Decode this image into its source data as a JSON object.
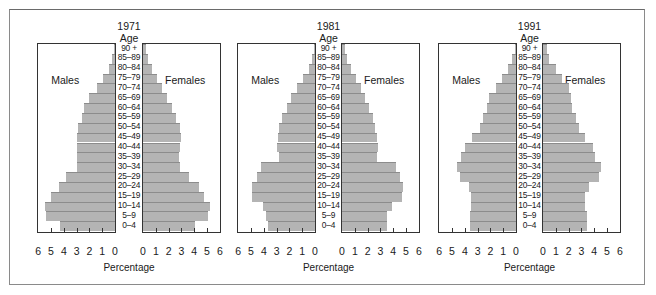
{
  "chart_data": [
    {
      "type": "bar",
      "subtype": "population-pyramid",
      "title": "1971",
      "ylabel": "Age",
      "xlabel": "Percentage",
      "left_label": "Males",
      "right_label": "Females",
      "xlim": [
        0,
        6
      ],
      "x_ticks": [
        6,
        5,
        4,
        3,
        2,
        1,
        0,
        0,
        1,
        2,
        3,
        4,
        5,
        6
      ],
      "categories": [
        "90 +",
        "85–89",
        "80–84",
        "75–79",
        "70–74",
        "65–69",
        "60–64",
        "55–59",
        "50–54",
        "45–49",
        "40–44",
        "35–39",
        "30–34",
        "25–29",
        "20–24",
        "15–19",
        "10–14",
        "5–9",
        "0–4"
      ],
      "series": [
        {
          "name": "Males",
          "values": [
            0.1,
            0.2,
            0.5,
            0.9,
            1.4,
            2.0,
            2.4,
            2.6,
            2.9,
            3.0,
            3.0,
            3.0,
            3.0,
            3.8,
            4.4,
            5.0,
            5.5,
            5.4,
            4.3
          ]
        },
        {
          "name": "Females",
          "values": [
            0.2,
            0.4,
            0.7,
            1.1,
            1.5,
            1.9,
            2.3,
            2.6,
            2.9,
            3.0,
            2.9,
            2.8,
            2.9,
            3.6,
            4.4,
            4.8,
            5.2,
            5.1,
            4.1
          ]
        }
      ]
    },
    {
      "type": "bar",
      "subtype": "population-pyramid",
      "title": "1981",
      "ylabel": "Age",
      "xlabel": "Percentage",
      "left_label": "Males",
      "right_label": "Females",
      "xlim": [
        0,
        6
      ],
      "x_ticks": [
        6,
        5,
        4,
        3,
        2,
        1,
        0,
        0,
        1,
        2,
        3,
        4,
        5,
        6
      ],
      "categories": [
        "90 +",
        "85–89",
        "80–84",
        "75–79",
        "70–74",
        "65–69",
        "60–64",
        "55–59",
        "50–54",
        "45–49",
        "40–44",
        "35–39",
        "30–34",
        "25–29",
        "20–24",
        "15–19",
        "10–14",
        "5–9",
        "0–4"
      ],
      "series": [
        {
          "name": "Males",
          "values": [
            0.1,
            0.2,
            0.5,
            0.9,
            1.4,
            1.9,
            2.2,
            2.6,
            2.8,
            2.9,
            3.0,
            2.8,
            4.2,
            4.5,
            4.9,
            4.9,
            4.1,
            3.8,
            3.7
          ]
        },
        {
          "name": "Females",
          "values": [
            0.2,
            0.4,
            0.7,
            1.1,
            1.5,
            1.8,
            2.1,
            2.4,
            2.6,
            2.7,
            2.8,
            2.7,
            4.2,
            4.5,
            4.8,
            4.7,
            3.9,
            3.5,
            3.5
          ]
        }
      ]
    },
    {
      "type": "bar",
      "subtype": "population-pyramid",
      "title": "1991",
      "ylabel": "Age",
      "xlabel": "Percentage",
      "left_label": "Males",
      "right_label": "Females",
      "xlim": [
        0,
        6
      ],
      "x_ticks": [
        6,
        5,
        4,
        3,
        2,
        1,
        0,
        0,
        1,
        2,
        3,
        4,
        5,
        6
      ],
      "categories": [
        "90 +",
        "85–89",
        "80–84",
        "75–79",
        "70–74",
        "65–69",
        "60–64",
        "55–59",
        "50–54",
        "45–49",
        "40–44",
        "35–39",
        "30–34",
        "25–29",
        "20–24",
        "15–19",
        "10–14",
        "5–9",
        "0–4"
      ],
      "series": [
        {
          "name": "Males",
          "values": [
            0.1,
            0.3,
            0.6,
            1.1,
            1.6,
            2.1,
            2.3,
            2.6,
            2.8,
            3.4,
            4.0,
            4.3,
            4.6,
            4.4,
            3.7,
            3.5,
            3.5,
            3.6,
            3.6
          ]
        },
        {
          "name": "Females",
          "values": [
            0.3,
            0.5,
            1.0,
            1.5,
            2.0,
            2.2,
            2.3,
            2.6,
            2.8,
            3.3,
            3.9,
            4.1,
            4.5,
            4.4,
            3.6,
            3.3,
            3.3,
            3.4,
            3.4
          ]
        }
      ]
    }
  ],
  "pyramids": [
    {
      "year": "1971",
      "age_heading": "Age",
      "males": "Males",
      "females": "Females",
      "xlabel": "Percentage"
    },
    {
      "year": "1981",
      "age_heading": "Age",
      "males": "Males",
      "females": "Females",
      "xlabel": "Percentage"
    },
    {
      "year": "1991",
      "age_heading": "Age",
      "males": "Males",
      "females": "Females",
      "xlabel": "Percentage"
    }
  ],
  "style": {
    "bar_fill": "#b4b4b4",
    "bar_edge": "#8c8c8c",
    "axis": "#333333",
    "frame": "#8a8a8a"
  }
}
